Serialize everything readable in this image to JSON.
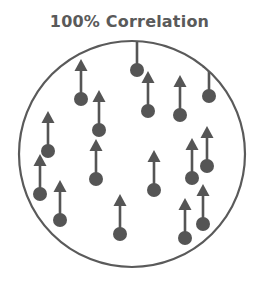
{
  "title": "100% Correlation",
  "diagram": {
    "correlation_percent": 100,
    "particle_count": 16,
    "particle_orientation": "up",
    "particles": [
      {
        "id": 1,
        "direction": "up"
      },
      {
        "id": 2,
        "direction": "up"
      },
      {
        "id": 3,
        "direction": "up"
      },
      {
        "id": 4,
        "direction": "up"
      },
      {
        "id": 5,
        "direction": "up"
      },
      {
        "id": 6,
        "direction": "up"
      },
      {
        "id": 7,
        "direction": "up"
      },
      {
        "id": 8,
        "direction": "up"
      },
      {
        "id": 9,
        "direction": "up"
      },
      {
        "id": 10,
        "direction": "up"
      },
      {
        "id": 11,
        "direction": "up"
      },
      {
        "id": 12,
        "direction": "up"
      },
      {
        "id": 13,
        "direction": "up"
      },
      {
        "id": 14,
        "direction": "up"
      },
      {
        "id": 15,
        "direction": "up"
      },
      {
        "id": 16,
        "direction": "up"
      }
    ],
    "colors": {
      "outline": "#5a5a5a",
      "particle": "#555555",
      "arrow": "#555555",
      "title": "#5a5a5a"
    }
  }
}
